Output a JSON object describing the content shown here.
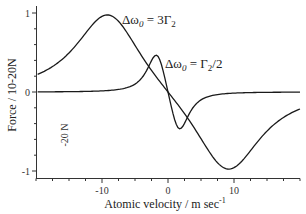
{
  "chart_data": {
    "type": "line",
    "title": "",
    "xlabel": "Atomic velocity / m sec",
    "xlabel_superscript": "-1",
    "ylabel": "Force / 10-20N",
    "xlim": [
      -20,
      20
    ],
    "ylim": [
      -1.1,
      1.1
    ],
    "x_ticks": [
      -10,
      0,
      10
    ],
    "x_tick_labels": [
      "-10",
      "0",
      "10"
    ],
    "y_ticks": [
      1,
      0,
      -1
    ],
    "y_tick_labels": [
      "1",
      "0",
      "-1"
    ],
    "grid": false,
    "legend": null,
    "series": [
      {
        "name": "Δω0 = 3Γ2",
        "label_main": "Δω",
        "label_sub": "0",
        "label_rest": " = 3Γ",
        "label_rest_sub": "2",
        "delta_over_gamma": 3,
        "peak": {
          "x": -9,
          "y": 1.05
        },
        "trough": {
          "x": 9,
          "y": -1.02
        },
        "x": [
          -20,
          -18,
          -16,
          -14,
          -12,
          -10,
          -9,
          -8,
          -6,
          -4,
          -2,
          0,
          2,
          4,
          6,
          8,
          9,
          10,
          12,
          14,
          16,
          18,
          20
        ],
        "values": [
          0.14,
          0.18,
          0.26,
          0.4,
          0.66,
          0.99,
          1.05,
          0.98,
          0.72,
          0.45,
          0.22,
          0.0,
          -0.22,
          -0.45,
          -0.72,
          -0.98,
          -1.02,
          -0.99,
          -0.66,
          -0.4,
          -0.26,
          -0.18,
          -0.14
        ]
      },
      {
        "name": "Δω0 = Γ2/2",
        "label_main": "Δω",
        "label_sub": "0",
        "label_rest": " = Γ",
        "label_rest_sub": "2",
        "label_tail": "/2",
        "delta_over_gamma": 0.5,
        "peak": {
          "x": -2.5,
          "y": 0.54
        },
        "trough": {
          "x": 2.4,
          "y": -0.49
        },
        "x": [
          -20,
          -16,
          -12,
          -8,
          -6,
          -4,
          -3,
          -2.5,
          -2,
          -1,
          0,
          1,
          2,
          2.5,
          3,
          4,
          6,
          8,
          12,
          16,
          20
        ],
        "values": [
          0.02,
          0.03,
          0.05,
          0.12,
          0.2,
          0.38,
          0.5,
          0.54,
          0.52,
          0.3,
          0.0,
          -0.3,
          -0.48,
          -0.49,
          -0.46,
          -0.34,
          -0.19,
          -0.11,
          -0.05,
          -0.03,
          -0.02
        ]
      }
    ],
    "annotations": [
      {
        "text": "-20 N",
        "rotated": true,
        "x": -16.5,
        "y": -0.3
      }
    ]
  },
  "labels": {
    "ylabel": "Force / 10-20N",
    "xlabel": "Atomic velocity / m sec",
    "xlabel_sup": "-1",
    "stray_note": "-20 N",
    "curve1": {
      "delta": "Δω",
      "sub": "0",
      "eq": " = 3Γ",
      "gsub": "2"
    },
    "curve2": {
      "delta": "Δω",
      "sub": "0",
      "eq": " = Γ",
      "gsub": "2",
      "tail": "/2"
    }
  },
  "colors": {
    "line": "#1a1a1a",
    "axis": "#333333",
    "background": "#ffffff"
  }
}
